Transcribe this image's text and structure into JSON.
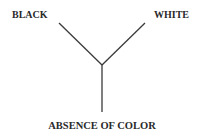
{
  "diagram": {
    "labels": {
      "top_left": "BLACK",
      "top_right": "WHITE",
      "bottom": "ABSENCE OF COLOR"
    },
    "line_color": "#3a3a3a",
    "shape": "Y-junction connecting three labels"
  }
}
